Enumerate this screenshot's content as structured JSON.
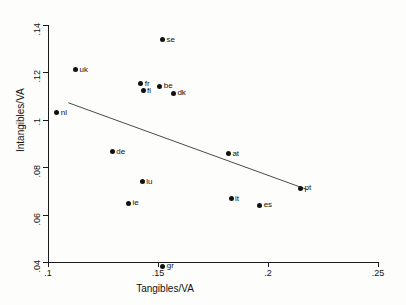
{
  "chart_data": {
    "type": "scatter",
    "title": "",
    "xlabel": "Tangibles/VA",
    "ylabel": "Intangibles/VA",
    "xlim": [
      0.1,
      0.25
    ],
    "ylim": [
      0.04,
      0.14
    ],
    "xticks": [
      ".1",
      ".15",
      ".2",
      ".25"
    ],
    "xtick_values": [
      0.1,
      0.15,
      0.2,
      0.25
    ],
    "yticks": [
      ".04",
      ".06",
      ".08",
      ".1",
      ".12",
      ".14"
    ],
    "ytick_values": [
      0.04,
      0.06,
      0.08,
      0.1,
      0.12,
      0.14
    ],
    "grid": false,
    "legend": "none",
    "marker": "filled-circle",
    "marker_color": "#111111",
    "points": [
      {
        "label": "se",
        "x": 0.152,
        "y": 0.1338
      },
      {
        "label": "uk",
        "x": 0.1125,
        "y": 0.1212
      },
      {
        "label": "fr",
        "x": 0.1422,
        "y": 0.1152
      },
      {
        "label": "be",
        "x": 0.1508,
        "y": 0.1142
      },
      {
        "label": "fi",
        "x": 0.1432,
        "y": 0.1122
      },
      {
        "label": "dk",
        "x": 0.157,
        "y": 0.1112
      },
      {
        "label": "nl",
        "x": 0.104,
        "y": 0.103
      },
      {
        "label": "de",
        "x": 0.1292,
        "y": 0.0866
      },
      {
        "label": "at",
        "x": 0.182,
        "y": 0.0856
      },
      {
        "label": "lu",
        "x": 0.1428,
        "y": 0.0738
      },
      {
        "label": "it",
        "x": 0.1832,
        "y": 0.0666
      },
      {
        "label": "ie",
        "x": 0.1366,
        "y": 0.0648
      },
      {
        "label": "es",
        "x": 0.1962,
        "y": 0.064
      },
      {
        "label": "pt",
        "x": 0.2148,
        "y": 0.0712
      },
      {
        "label": "gr",
        "x": 0.1522,
        "y": 0.0383
      }
    ],
    "fit_line": {
      "name": "linear fit",
      "x_start": 0.1092,
      "y_start": 0.1072,
      "x_end": 0.218,
      "y_end": 0.0705,
      "color": "#4a4a4a"
    }
  },
  "axes": {
    "x_title": "Tangibles/VA",
    "y_title": "Intangibles/VA"
  }
}
